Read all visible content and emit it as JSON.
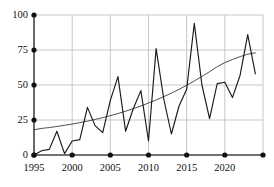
{
  "chart_data": {
    "type": "line",
    "title": "",
    "xlabel": "",
    "ylabel": "",
    "xlim": [
      1995,
      2025
    ],
    "ylim": [
      0,
      100
    ],
    "grid": true,
    "legend": "none",
    "xticks": [
      1995,
      2000,
      2005,
      2010,
      2015,
      2020
    ],
    "xtick_labels": [
      "1995",
      "2000",
      "2005",
      "2010",
      "2015",
      "2020"
    ],
    "yticks": [
      0,
      25,
      50,
      75,
      100
    ],
    "ytick_labels": [
      "0",
      "25",
      "50",
      "75",
      "100"
    ],
    "x": [
      1995,
      1996,
      1997,
      1998,
      1999,
      2000,
      2001,
      2002,
      2003,
      2004,
      2005,
      2006,
      2007,
      2008,
      2009,
      2010,
      2011,
      2012,
      2013,
      2014,
      2015,
      2016,
      2017,
      2018,
      2019,
      2020,
      2021,
      2022,
      2023,
      2024
    ],
    "series": [
      {
        "name": "observed",
        "type": "line",
        "color": "#1a1a1a",
        "values": [
          0,
          3,
          4,
          17,
          1,
          10,
          11,
          34,
          21,
          16,
          39,
          56,
          17,
          33,
          46,
          10,
          76,
          40,
          15,
          35,
          47,
          94,
          50,
          26,
          51,
          52,
          41,
          57,
          86,
          58
        ]
      },
      {
        "name": "trend",
        "type": "line",
        "color": "#3a3a3a",
        "values": [
          18,
          19,
          19.6,
          20.4,
          21.2,
          22.1,
          23.1,
          24.2,
          25.4,
          26.7,
          28.1,
          29.6,
          31.3,
          33.1,
          35.0,
          37.1,
          39.3,
          41.7,
          44.2,
          46.9,
          49.8,
          52.9,
          56.1,
          59.5,
          63.1,
          66.0,
          68.2,
          70.3,
          72.0,
          73.0
        ]
      }
    ],
    "axis_markers": {
      "x_marker_years": [
        1995,
        2000,
        2005,
        2010,
        2015,
        2020,
        2025
      ],
      "y_marker_values": [
        0,
        25,
        50,
        75,
        100
      ],
      "marker_shape": "filled-circle",
      "marker_color": "#111111"
    },
    "style": {
      "background": "#ffffff",
      "grid_color": "#b9b9b9",
      "axis_color": "#444444",
      "line_color": "#1a1a1a",
      "trend_color": "#3a3a3a"
    }
  }
}
